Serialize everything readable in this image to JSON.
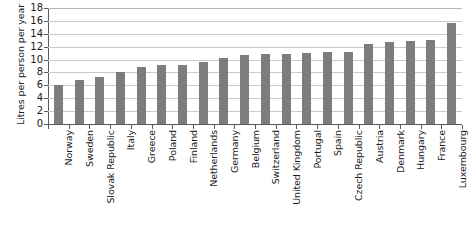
{
  "chart_data": {
    "type": "bar",
    "title": "",
    "xlabel": "",
    "ylabel": "Litres per person per year",
    "ylim": [
      0,
      18
    ],
    "yticks": [
      0,
      2,
      4,
      6,
      8,
      10,
      12,
      14,
      16,
      18
    ],
    "grid": true,
    "legend": null,
    "bar_color": "#7d7d7d",
    "categories": [
      "Norway",
      "Sweden",
      "Slovak Republic",
      "Italy",
      "Greece",
      "Poland",
      "Finland",
      "Netherlands",
      "Germany",
      "Belgium",
      "Switzerland",
      "United Kingdom",
      "Portugal",
      "Spain",
      "Czech Republic",
      "Austria",
      "Denmark",
      "Hungary",
      "France",
      "Luxembourg"
    ],
    "values": [
      6.0,
      6.9,
      7.3,
      8.0,
      8.9,
      9.1,
      9.2,
      9.7,
      10.2,
      10.7,
      10.8,
      10.9,
      11.0,
      11.1,
      11.2,
      12.4,
      12.8,
      12.9,
      13.0,
      15.6
    ]
  }
}
